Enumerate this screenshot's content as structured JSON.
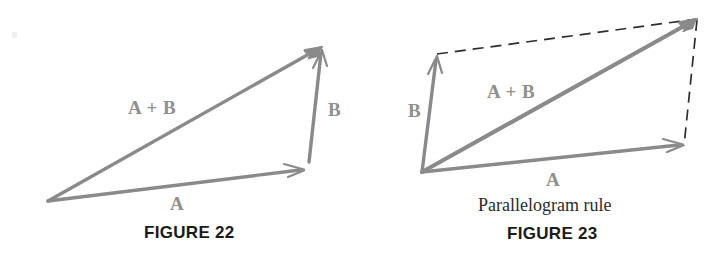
{
  "figure22": {
    "labels": {
      "sum": "A + B",
      "b": "B",
      "a": "A"
    },
    "caption": "FIGURE 22",
    "vectors": {
      "sum": {
        "x1": 48,
        "y1": 201,
        "x2": 321,
        "y2": 47,
        "name": "A + B"
      },
      "a": {
        "x1": 48,
        "y1": 201,
        "x2": 304,
        "y2": 170,
        "name": "A"
      },
      "b": {
        "x1": 309,
        "y1": 160,
        "x2": 322,
        "y2": 50,
        "name": "B"
      }
    }
  },
  "figure23": {
    "labels": {
      "b": "B",
      "sum": "A + B",
      "a": "A"
    },
    "subcaption": "Parallelogram rule",
    "caption": "FIGURE 23",
    "vectors": {
      "b": {
        "x1": 422,
        "y1": 172,
        "x2": 437,
        "y2": 56,
        "name": "B"
      },
      "sum": {
        "x1": 422,
        "y1": 172,
        "x2": 696,
        "y2": 19,
        "name": "A + B"
      },
      "a": {
        "x1": 422,
        "y1": 172,
        "x2": 683,
        "y2": 145,
        "name": "A"
      }
    },
    "dashed": {
      "top": {
        "x1": 437,
        "y1": 54,
        "x2": 697,
        "y2": 19,
        "name": "dashed-top-edge"
      },
      "right": {
        "x1": 697,
        "y1": 19,
        "x2": 684,
        "y2": 146,
        "name": "dashed-right-edge"
      }
    }
  },
  "colors": {
    "vector": "#8a8a8a",
    "vector_label": "#8f8f8f",
    "dashed": "#2e2e2e",
    "caption": "#1a1a1a",
    "background": "#ffffff"
  }
}
